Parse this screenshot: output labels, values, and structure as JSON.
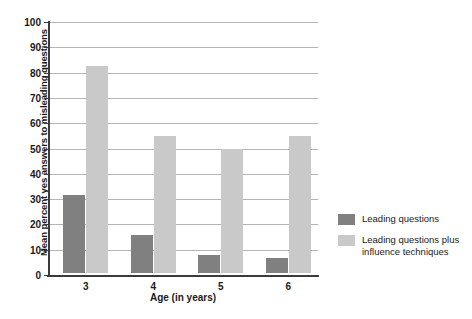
{
  "chart_data": {
    "type": "bar",
    "title": "",
    "xlabel": "Age (in years)",
    "ylabel": "Mean percent yes answers to misleading questions",
    "categories": [
      "3",
      "4",
      "5",
      "6"
    ],
    "series": [
      {
        "name": "Leading questions",
        "color": "#808080",
        "values": [
          31,
          15,
          7,
          6
        ]
      },
      {
        "name": "Leading questions plus\ninfluence techniques",
        "color": "#c9c9c9",
        "values": [
          82,
          54,
          49,
          54
        ]
      }
    ],
    "ylim": [
      0,
      100
    ],
    "yticks": [
      0,
      10,
      20,
      30,
      40,
      50,
      60,
      70,
      80,
      90,
      100
    ],
    "ytick_labels": [
      "0",
      "10",
      "20",
      "30",
      "40",
      "50",
      "60",
      "70",
      "80",
      "90",
      "100"
    ],
    "grid": true,
    "legend_position": "right",
    "background_color": "#ffffff",
    "gridline_color": "#b5b5b5",
    "axis_color": "#3a3a3a"
  },
  "legend": {
    "entries": [
      {
        "label": "Leading questions",
        "color": "#808080"
      },
      {
        "label": "Leading questions plus\ninfluence techniques",
        "color": "#c9c9c9"
      }
    ]
  }
}
